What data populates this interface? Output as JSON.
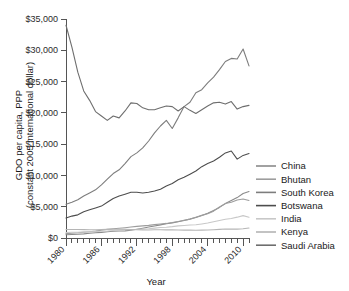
{
  "chart_data": {
    "type": "line",
    "title": "",
    "xlabel": "Year",
    "ylabel": "GDO per capita, PPP\n(constant 2005 international dollar)",
    "ylabel_line1": "GDO per capita, PPP",
    "ylabel_line2": "(constant 2005 international dollar)",
    "xlim": [
      1980,
      2011
    ],
    "ylim": [
      0,
      35000
    ],
    "grid": false,
    "legend_position": "right",
    "ytick_labels": [
      "$0",
      "$5,000",
      "$10,000",
      "$15,000",
      "$20,000",
      "$25,000",
      "$30,000",
      "$35,000"
    ],
    "ytick_values": [
      0,
      5000,
      10000,
      15000,
      20000,
      25000,
      30000,
      35000
    ],
    "xtick_labels": [
      "1980",
      "1986",
      "1992",
      "1998",
      "2004",
      "2010"
    ],
    "xtick_values": [
      1980,
      1986,
      1992,
      1998,
      2004,
      2010
    ],
    "x": [
      1980,
      1981,
      1982,
      1983,
      1984,
      1985,
      1986,
      1987,
      1988,
      1989,
      1990,
      1991,
      1992,
      1993,
      1994,
      1995,
      1996,
      1997,
      1998,
      1999,
      2000,
      2001,
      2002,
      2003,
      2004,
      2005,
      2006,
      2007,
      2008,
      2009,
      2010,
      2011
    ],
    "series": [
      {
        "name": "China",
        "color": "#8a8a8a",
        "values": [
          520,
          550,
          600,
          660,
          750,
          840,
          900,
          990,
          1080,
          1110,
          1140,
          1240,
          1400,
          1570,
          1760,
          1930,
          2100,
          2270,
          2420,
          2590,
          2810,
          3020,
          3280,
          3590,
          3950,
          4380,
          4890,
          5500,
          5980,
          6460,
          7120,
          7420
        ]
      },
      {
        "name": "Bhutan",
        "color": "#9d9d9d",
        "values": [
          700,
          760,
          830,
          920,
          1010,
          1100,
          1250,
          1380,
          1480,
          1560,
          1650,
          1760,
          1850,
          1930,
          2020,
          2140,
          2240,
          2330,
          2470,
          2640,
          2830,
          3020,
          3330,
          3620,
          3880,
          4290,
          4960,
          5520,
          5720,
          6080,
          6230,
          6000
        ]
      },
      {
        "name": "South Korea",
        "color": "#7d7d7d",
        "values": [
          5400,
          5700,
          6100,
          6700,
          7200,
          7700,
          8500,
          9400,
          10300,
          10900,
          11900,
          13000,
          13600,
          14400,
          15500,
          16800,
          17900,
          18800,
          17500,
          19200,
          21000,
          21700,
          23200,
          23700,
          24800,
          25700,
          26900,
          28200,
          28700,
          28600,
          30200,
          27500
        ]
      },
      {
        "name": "Botswana",
        "color": "#4d4d4d",
        "values": [
          3200,
          3500,
          3700,
          4200,
          4500,
          4800,
          5100,
          5700,
          6300,
          6700,
          7000,
          7300,
          7300,
          7200,
          7300,
          7500,
          7800,
          8300,
          8700,
          9300,
          9700,
          10200,
          10700,
          11400,
          11900,
          12300,
          12900,
          13600,
          13900,
          12600,
          13200,
          13500
        ]
      },
      {
        "name": "India",
        "color": "#c8c8c8",
        "values": [
          890,
          910,
          930,
          980,
          1010,
          1050,
          1090,
          1110,
          1200,
          1260,
          1320,
          1320,
          1370,
          1420,
          1490,
          1580,
          1680,
          1730,
          1820,
          1940,
          2000,
          2070,
          2110,
          2250,
          2400,
          2590,
          2790,
          3000,
          3110,
          3330,
          3580,
          3320
        ]
      },
      {
        "name": "Kenya",
        "color": "#b5b5b5",
        "values": [
          1370,
          1370,
          1360,
          1340,
          1320,
          1330,
          1360,
          1380,
          1400,
          1410,
          1410,
          1370,
          1320,
          1290,
          1290,
          1310,
          1320,
          1300,
          1300,
          1290,
          1260,
          1270,
          1250,
          1260,
          1290,
          1330,
          1380,
          1440,
          1420,
          1420,
          1480,
          1600
        ]
      },
      {
        "name": "Saudi Arabia",
        "color": "#6e6e6e",
        "values": [
          34000,
          30500,
          26500,
          23500,
          22000,
          20200,
          19500,
          18800,
          19500,
          19200,
          20300,
          21600,
          21500,
          20800,
          20500,
          20500,
          20800,
          21100,
          21000,
          20300,
          21000,
          20400,
          19900,
          20500,
          21100,
          21600,
          21700,
          21400,
          21800,
          20600,
          21000,
          21200
        ]
      }
    ]
  },
  "legend": {
    "items": [
      {
        "label": "China"
      },
      {
        "label": "Bhutan"
      },
      {
        "label": "South Korea"
      },
      {
        "label": "Botswana"
      },
      {
        "label": "India"
      },
      {
        "label": "Kenya"
      },
      {
        "label": "Saudi Arabia"
      }
    ]
  }
}
